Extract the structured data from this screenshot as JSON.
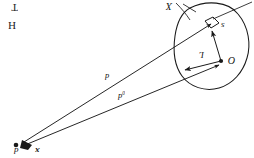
{
  "figure": {
    "background_color": "#ffffff",
    "ink_color": "#1a1a1a",
    "orientation_note": "rotated-180",
    "corner_text": {
      "line1": "T",
      "line2": "H"
    },
    "region": {
      "name": "closed-blob-region",
      "outline_color": "#1a1a1a"
    },
    "labels": {
      "region_label": "X",
      "element_vector": "s",
      "center_vector": "L",
      "origin_point": "O",
      "ray_upper": "d",
      "ray_lower_base": "d",
      "ray_lower_sub": "0",
      "vertex_left": "d",
      "vertex_right": "x"
    },
    "points": [
      {
        "name": "origin-O",
        "label": "O",
        "x": 221,
        "y": 61
      },
      {
        "name": "vertex-apex",
        "label": "x",
        "x": 23,
        "y": 144
      }
    ],
    "vectors": [
      {
        "name": "vector-L",
        "label": "L",
        "from": "O",
        "to": "region-lower-left-edge"
      },
      {
        "name": "vector-s",
        "label": "s",
        "from": "O",
        "to": "square-element"
      }
    ],
    "rays": [
      {
        "name": "ray-d",
        "label": "d",
        "from": "vertex-apex",
        "to": "square-element"
      },
      {
        "name": "ray-d0",
        "label": "d0",
        "from": "vertex-apex",
        "to": "region-edge"
      }
    ],
    "elements": [
      {
        "name": "area-element-square",
        "shape": "small-square"
      }
    ]
  }
}
